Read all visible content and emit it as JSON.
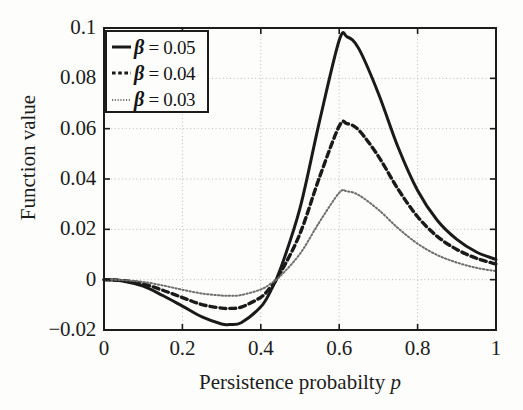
{
  "chart_data": {
    "type": "line",
    "title": "",
    "xlabel": "Persistence  probabilty p",
    "ylabel": "Function value",
    "xlim": [
      0,
      1
    ],
    "ylim": [
      -0.02,
      0.1
    ],
    "xticks": [
      "0",
      "0.2",
      "0.4",
      "0.6",
      "0.8",
      "1"
    ],
    "xtick_values": [
      0,
      0.2,
      0.4,
      0.6,
      0.8,
      1
    ],
    "yticks": [
      "0.1",
      "0.08",
      "0.06",
      "0.04",
      "0.02",
      "0",
      "−0.02"
    ],
    "ytick_values": [
      0.1,
      0.08,
      0.06,
      0.04,
      0.02,
      0,
      -0.02
    ],
    "grid": true,
    "grid_style": "dotted",
    "legend_position": "top-left",
    "x": [
      0,
      0.05,
      0.1,
      0.15,
      0.2,
      0.25,
      0.3,
      0.32,
      0.35,
      0.4,
      0.425,
      0.45,
      0.5,
      0.55,
      0.6,
      0.62,
      0.65,
      0.7,
      0.75,
      0.8,
      0.85,
      0.9,
      0.95,
      1
    ],
    "series": [
      {
        "name": "β = 0.05",
        "beta": 0.05,
        "style": "solid",
        "color": "#1a1a1a",
        "values": [
          0.0,
          -0.0006,
          -0.0026,
          -0.0063,
          -0.0105,
          -0.0148,
          -0.0176,
          -0.0178,
          -0.0171,
          -0.0108,
          -0.0045,
          0.0042,
          0.0284,
          0.0631,
          0.0951,
          0.0965,
          0.0918,
          0.074,
          0.0527,
          0.0354,
          0.0236,
          0.016,
          0.011,
          0.008
        ]
      },
      {
        "name": "β = 0.04",
        "beta": 0.04,
        "style": "dashed",
        "color": "#1a1a1a",
        "values": [
          0.0,
          -0.0004,
          -0.0017,
          -0.0042,
          -0.0071,
          -0.0099,
          -0.0113,
          -0.0114,
          -0.0109,
          -0.007,
          -0.0029,
          0.0027,
          0.0183,
          0.0408,
          0.061,
          0.062,
          0.0594,
          0.049,
          0.036,
          0.025,
          0.0172,
          0.012,
          0.0085,
          0.0062
        ]
      },
      {
        "name": "β = 0.03",
        "beta": 0.03,
        "style": "dotted",
        "color": "#6e6e6e",
        "values": [
          0.0,
          -0.0002,
          -0.0009,
          -0.0023,
          -0.004,
          -0.0055,
          -0.0063,
          -0.0064,
          -0.0061,
          -0.0039,
          -0.0016,
          0.0015,
          0.0103,
          0.023,
          0.0345,
          0.0351,
          0.0336,
          0.0278,
          0.0205,
          0.0143,
          0.0098,
          0.0068,
          0.0047,
          0.0034
        ]
      }
    ]
  },
  "legend": {
    "items": [
      {
        "sample": "solid-line-sample",
        "beta_symbol": "β",
        "equals_value": " = 0.05"
      },
      {
        "sample": "dashed-line-sample",
        "beta_symbol": "β",
        "equals_value": " = 0.04"
      },
      {
        "sample": "dotted-line-sample",
        "beta_symbol": "β",
        "equals_value": " = 0.03"
      }
    ]
  },
  "axes": {
    "ylabel": "Function value",
    "xlabel_prefix": "Persistence  probabilty ",
    "xlabel_variable": "p"
  }
}
